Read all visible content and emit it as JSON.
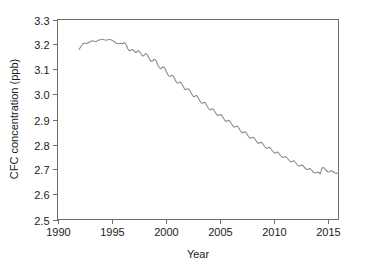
{
  "chart_data": {
    "type": "line",
    "title": "",
    "xlabel": "Year",
    "ylabel": "CFC concentration (ppb)",
    "xlim": [
      1990,
      2016.0
    ],
    "ylim": [
      2.5,
      3.3
    ],
    "grid": false,
    "legend": null,
    "line_color": "#8a8a8a",
    "axis_color": "#6e6e6e",
    "background": "#ffffff",
    "xticks": [
      1990,
      1995,
      2000,
      2005,
      2010,
      2015
    ],
    "xtick_labels": [
      "1990",
      "1995",
      "2000",
      "2005",
      "2010",
      "2015"
    ],
    "yticks": [
      2.5,
      2.6,
      2.7,
      2.8,
      2.9,
      3.0,
      3.1,
      3.2,
      3.3
    ],
    "ytick_labels": [
      "2.5",
      "2.6",
      "2.7",
      "2.8",
      "2.9",
      "3.0",
      "3.1",
      "3.2",
      "3.3"
    ],
    "series": [
      {
        "name": "CFC concentration",
        "x": [
          1992.0,
          1992.08,
          1992.17,
          1992.25,
          1992.33,
          1992.42,
          1992.5,
          1992.58,
          1992.67,
          1992.75,
          1992.83,
          1992.92,
          1993.0,
          1993.08,
          1993.17,
          1993.25,
          1993.33,
          1993.42,
          1993.5,
          1993.58,
          1993.67,
          1993.75,
          1993.83,
          1993.92,
          1994.0,
          1994.08,
          1994.17,
          1994.25,
          1994.33,
          1994.42,
          1994.5,
          1994.58,
          1994.67,
          1994.75,
          1994.83,
          1994.92,
          1995.0,
          1995.08,
          1995.17,
          1995.25,
          1995.33,
          1995.42,
          1995.5,
          1995.58,
          1995.67,
          1995.75,
          1995.83,
          1995.92,
          1996.0,
          1996.08,
          1996.17,
          1996.25,
          1996.33,
          1996.42,
          1996.5,
          1996.58,
          1996.67,
          1996.75,
          1996.83,
          1996.92,
          1997.0,
          1997.08,
          1997.17,
          1997.25,
          1997.33,
          1997.42,
          1997.5,
          1997.58,
          1997.67,
          1997.75,
          1997.83,
          1997.92,
          1998.0,
          1998.08,
          1998.17,
          1998.25,
          1998.33,
          1998.42,
          1998.5,
          1998.58,
          1998.67,
          1998.75,
          1998.83,
          1998.92,
          1999.0,
          1999.08,
          1999.17,
          1999.25,
          1999.33,
          1999.42,
          1999.5,
          1999.58,
          1999.67,
          1999.75,
          1999.83,
          1999.92,
          2000.0,
          2000.08,
          2000.17,
          2000.25,
          2000.33,
          2000.42,
          2000.5,
          2000.58,
          2000.67,
          2000.75,
          2000.83,
          2000.92,
          2001.0,
          2001.08,
          2001.17,
          2001.25,
          2001.33,
          2001.42,
          2001.5,
          2001.58,
          2001.67,
          2001.75,
          2001.83,
          2001.92,
          2002.0,
          2002.08,
          2002.17,
          2002.25,
          2002.33,
          2002.42,
          2002.5,
          2002.58,
          2002.67,
          2002.75,
          2002.83,
          2002.92,
          2003.0,
          2003.08,
          2003.17,
          2003.25,
          2003.33,
          2003.42,
          2003.5,
          2003.58,
          2003.67,
          2003.75,
          2003.83,
          2003.92,
          2004.0,
          2004.08,
          2004.17,
          2004.25,
          2004.33,
          2004.42,
          2004.5,
          2004.58,
          2004.67,
          2004.75,
          2004.83,
          2004.92,
          2005.0,
          2005.08,
          2005.17,
          2005.25,
          2005.33,
          2005.42,
          2005.5,
          2005.58,
          2005.67,
          2005.75,
          2005.83,
          2005.92,
          2006.0,
          2006.08,
          2006.17,
          2006.25,
          2006.33,
          2006.42,
          2006.5,
          2006.58,
          2006.67,
          2006.75,
          2006.83,
          2006.92,
          2007.0,
          2007.08,
          2007.17,
          2007.25,
          2007.33,
          2007.42,
          2007.5,
          2007.58,
          2007.67,
          2007.75,
          2007.83,
          2007.92,
          2008.0,
          2008.08,
          2008.17,
          2008.25,
          2008.33,
          2008.42,
          2008.5,
          2008.58,
          2008.67,
          2008.75,
          2008.83,
          2008.92,
          2009.0,
          2009.08,
          2009.17,
          2009.25,
          2009.33,
          2009.42,
          2009.5,
          2009.58,
          2009.67,
          2009.75,
          2009.83,
          2009.92,
          2010.0,
          2010.08,
          2010.17,
          2010.25,
          2010.33,
          2010.42,
          2010.5,
          2010.58,
          2010.67,
          2010.75,
          2010.83,
          2010.92,
          2011.0,
          2011.08,
          2011.17,
          2011.25,
          2011.33,
          2011.42,
          2011.5,
          2011.58,
          2011.67,
          2011.75,
          2011.83,
          2011.92,
          2012.0,
          2012.08,
          2012.17,
          2012.25,
          2012.33,
          2012.42,
          2012.5,
          2012.58,
          2012.67,
          2012.75,
          2012.83,
          2012.92,
          2013.0,
          2013.08,
          2013.17,
          2013.25,
          2013.33,
          2013.42,
          2013.5,
          2013.58,
          2013.67,
          2013.75,
          2013.83,
          2013.92,
          2014.0,
          2014.08,
          2014.17,
          2014.25,
          2014.33,
          2014.42,
          2014.5,
          2014.58,
          2014.67,
          2014.75,
          2014.83,
          2014.92,
          2015.0,
          2015.08,
          2015.17,
          2015.25,
          2015.33,
          2015.42,
          2015.5,
          2015.58,
          2015.67,
          2015.75,
          2015.83,
          2015.92,
          2016.0
        ],
        "values": [
          3.18,
          3.186,
          3.192,
          3.197,
          3.201,
          3.204,
          3.206,
          3.205,
          3.204,
          3.205,
          3.207,
          3.209,
          3.211,
          3.213,
          3.214,
          3.215,
          3.214,
          3.212,
          3.211,
          3.212,
          3.214,
          3.216,
          3.218,
          3.219,
          3.22,
          3.221,
          3.221,
          3.22,
          3.219,
          3.218,
          3.217,
          3.218,
          3.219,
          3.22,
          3.22,
          3.219,
          3.218,
          3.216,
          3.214,
          3.212,
          3.209,
          3.206,
          3.204,
          3.203,
          3.203,
          3.204,
          3.205,
          3.204,
          3.202,
          3.205,
          3.208,
          3.206,
          3.2,
          3.192,
          3.184,
          3.178,
          3.175,
          3.176,
          3.179,
          3.18,
          3.178,
          3.174,
          3.17,
          3.168,
          3.17,
          3.174,
          3.176,
          3.172,
          3.166,
          3.16,
          3.156,
          3.154,
          3.156,
          3.16,
          3.163,
          3.162,
          3.157,
          3.15,
          3.143,
          3.137,
          3.133,
          3.133,
          3.136,
          3.14,
          3.141,
          3.137,
          3.13,
          3.122,
          3.114,
          3.108,
          3.104,
          3.104,
          3.107,
          3.11,
          3.11,
          3.106,
          3.099,
          3.091,
          3.083,
          3.077,
          3.073,
          3.073,
          3.075,
          3.077,
          3.075,
          3.07,
          3.063,
          3.056,
          3.05,
          3.046,
          3.046,
          3.048,
          3.05,
          3.048,
          3.043,
          3.036,
          3.029,
          3.023,
          3.02,
          3.02,
          3.022,
          3.023,
          3.021,
          3.016,
          3.009,
          3.002,
          2.996,
          2.992,
          2.992,
          2.994,
          2.996,
          2.994,
          2.989,
          2.982,
          2.975,
          2.969,
          2.965,
          2.965,
          2.967,
          2.969,
          2.967,
          2.962,
          2.955,
          2.948,
          2.943,
          2.939,
          2.939,
          2.941,
          2.943,
          2.941,
          2.936,
          2.93,
          2.924,
          2.919,
          2.916,
          2.917,
          2.919,
          2.92,
          2.918,
          2.913,
          2.907,
          2.901,
          2.896,
          2.893,
          2.893,
          2.895,
          2.897,
          2.895,
          2.89,
          2.884,
          2.878,
          2.873,
          2.87,
          2.87,
          2.872,
          2.874,
          2.872,
          2.867,
          2.861,
          2.855,
          2.85,
          2.847,
          2.847,
          2.849,
          2.851,
          2.849,
          2.844,
          2.838,
          2.832,
          2.828,
          2.825,
          2.826,
          2.828,
          2.829,
          2.827,
          2.823,
          2.818,
          2.812,
          2.808,
          2.805,
          2.805,
          2.807,
          2.809,
          2.807,
          2.803,
          2.798,
          2.792,
          2.788,
          2.785,
          2.785,
          2.787,
          2.789,
          2.787,
          2.783,
          2.778,
          2.773,
          2.769,
          2.766,
          2.766,
          2.768,
          2.77,
          2.768,
          2.764,
          2.759,
          2.754,
          2.75,
          2.748,
          2.749,
          2.751,
          2.752,
          2.75,
          2.746,
          2.742,
          2.737,
          2.733,
          2.731,
          2.731,
          2.733,
          2.735,
          2.733,
          2.729,
          2.725,
          2.72,
          2.716,
          2.714,
          2.714,
          2.716,
          2.718,
          2.716,
          2.713,
          2.709,
          2.705,
          2.702,
          2.7,
          2.7,
          2.702,
          2.704,
          2.702,
          2.698,
          2.694,
          2.69,
          2.687,
          2.686,
          2.687,
          2.689,
          2.69,
          2.688,
          2.685,
          2.682,
          2.7,
          2.706,
          2.708,
          2.706,
          2.702,
          2.698,
          2.694,
          2.691,
          2.69,
          2.691,
          2.693,
          2.695,
          2.694,
          2.691,
          2.688,
          2.686,
          2.685,
          2.685,
          2.686,
          2.685
        ]
      }
    ]
  }
}
